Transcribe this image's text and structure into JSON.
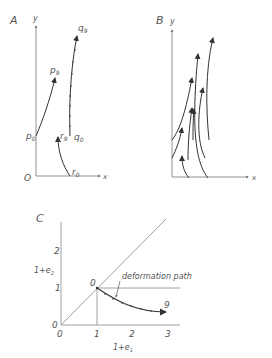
{
  "panel_a": {
    "label": "A",
    "y_axis": "y",
    "x_axis": "x",
    "origin": "O",
    "points": {
      "p0": "p",
      "p0_sub": "0",
      "p9": "p",
      "p9_sub": "9",
      "q0": "q",
      "q0_sub": "0",
      "q9": "q",
      "q9_sub": "9",
      "r0": "r",
      "r0_sub": "0",
      "r9": "r",
      "r9_sub": "9"
    }
  },
  "panel_b": {
    "label": "B",
    "y_axis": "y",
    "x_axis": "x"
  },
  "panel_c": {
    "label": "C",
    "y_axis": "1+e",
    "y_axis_sub": "2",
    "x_axis": "1+e",
    "x_axis_sub": "1",
    "x_ticks": [
      "0",
      "1",
      "2",
      "3"
    ],
    "y_ticks": [
      "0",
      "1",
      "2"
    ],
    "start_label": "0",
    "end_label": "9",
    "annotation": "deformation path"
  },
  "colors": {
    "line": "#555555",
    "curve": "#333333",
    "background": "#ffffff"
  }
}
